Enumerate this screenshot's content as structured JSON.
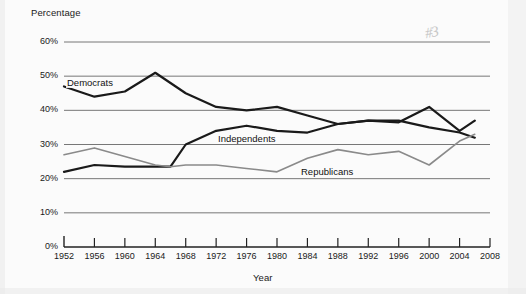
{
  "chart_data": {
    "type": "line",
    "title": "",
    "xlabel": "Year",
    "ylabel": "Percentage",
    "xlim": [
      1952,
      2008
    ],
    "ylim": [
      0,
      60
    ],
    "grid": true,
    "grid_axis": "y",
    "legend": "inline-labels",
    "x_ticks": [
      "1952",
      "1956",
      "1960",
      "1964",
      "1968",
      "1972",
      "1976",
      "1980",
      "1984",
      "1988",
      "1992",
      "1996",
      "2000",
      "2004",
      "2008"
    ],
    "y_ticks": [
      "0%",
      "10%",
      "20%",
      "30%",
      "40%",
      "50%",
      "60%"
    ],
    "x": [
      1952,
      1956,
      1960,
      1964,
      1966,
      1968,
      1972,
      1976,
      1980,
      1984,
      1988,
      1992,
      1996,
      2000,
      2004,
      2006
    ],
    "series": [
      {
        "name": "Democrats",
        "color": "#1a1a1a",
        "width": 2.2,
        "values": [
          47,
          44,
          45.5,
          51,
          48,
          45,
          41,
          40,
          41,
          38.5,
          36,
          37,
          36.5,
          41,
          34,
          37
        ]
      },
      {
        "name": "Independents",
        "color": "#1a1a1a",
        "width": 2.2,
        "values": [
          22,
          24,
          23.5,
          23.5,
          23.5,
          30,
          34,
          35.5,
          34,
          33.5,
          36,
          37,
          37,
          35,
          33.5,
          32
        ]
      },
      {
        "name": "Republicans",
        "color": "#8a8a8a",
        "width": 1.6,
        "values": [
          27,
          29,
          26.5,
          24,
          23.5,
          24,
          24,
          23,
          22,
          26,
          28.5,
          27,
          28,
          24,
          31,
          33
        ]
      }
    ],
    "annotations": [
      {
        "name": "pencil-mark",
        "text": "#3"
      }
    ]
  }
}
